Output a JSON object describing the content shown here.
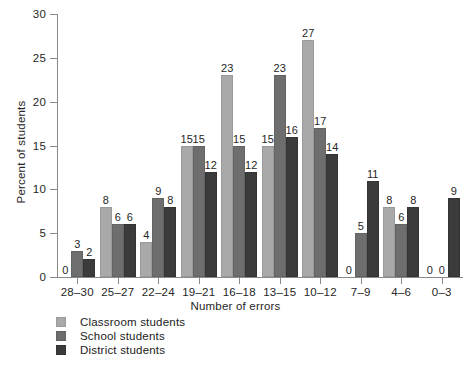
{
  "chart_data": {
    "type": "bar",
    "title": "",
    "xlabel": "Number of errors",
    "ylabel": "Percent of students",
    "ylim": [
      0,
      30
    ],
    "yticks": [
      0,
      5,
      10,
      15,
      20,
      25,
      30
    ],
    "grid": false,
    "legend_position": "bottom-left",
    "categories": [
      "28–30",
      "25–27",
      "22–24",
      "19–21",
      "16–18",
      "13–15",
      "10–12",
      "7–9",
      "4–6",
      "0–3"
    ],
    "series": [
      {
        "name": "Classroom students",
        "color": "#a9a9a9",
        "values": [
          0,
          8,
          4,
          15,
          23,
          15,
          27,
          0,
          8,
          0
        ]
      },
      {
        "name": "School students",
        "color": "#6e6e6e",
        "values": [
          3,
          6,
          9,
          15,
          15,
          23,
          17,
          5,
          6,
          0
        ]
      },
      {
        "name": "District students",
        "color": "#3b3b3b",
        "values": [
          2,
          6,
          8,
          12,
          12,
          16,
          14,
          11,
          8,
          9
        ]
      }
    ]
  },
  "legend": {
    "items": [
      {
        "label": "Classroom students",
        "swatch": "light-gray-swatch"
      },
      {
        "label": "School students",
        "swatch": "medium-gray-swatch"
      },
      {
        "label": "District students",
        "swatch": "dark-gray-swatch"
      }
    ]
  }
}
